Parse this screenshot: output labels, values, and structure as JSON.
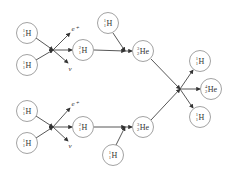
{
  "diagram": {
    "nodes": [
      {
        "id": "p1",
        "sym": "H",
        "mass": "1",
        "z": "1",
        "x": 27,
        "y": 33
      },
      {
        "id": "p2",
        "sym": "H",
        "mass": "1",
        "z": "1",
        "x": 27,
        "y": 65
      },
      {
        "id": "d1",
        "sym": "H",
        "mass": "2",
        "z": "1",
        "x": 83,
        "y": 50
      },
      {
        "id": "p5",
        "sym": "H",
        "mass": "1",
        "z": "1",
        "x": 108,
        "y": 23
      },
      {
        "id": "he3a",
        "sym": "He",
        "mass": "3",
        "z": "2",
        "x": 143,
        "y": 51
      },
      {
        "id": "p3",
        "sym": "H",
        "mass": "1",
        "z": "1",
        "x": 27,
        "y": 111
      },
      {
        "id": "p4",
        "sym": "H",
        "mass": "1",
        "z": "1",
        "x": 27,
        "y": 143
      },
      {
        "id": "d2",
        "sym": "H",
        "mass": "2",
        "z": "1",
        "x": 83,
        "y": 127
      },
      {
        "id": "p6",
        "sym": "H",
        "mass": "1",
        "z": "1",
        "x": 113,
        "y": 155
      },
      {
        "id": "he3b",
        "sym": "He",
        "mass": "3",
        "z": "2",
        "x": 143,
        "y": 127
      },
      {
        "id": "out1",
        "sym": "H",
        "mass": "1",
        "z": "1",
        "x": 200,
        "y": 61
      },
      {
        "id": "he4",
        "sym": "He",
        "mass": "4",
        "z": "2",
        "x": 211,
        "y": 89
      },
      {
        "id": "out2",
        "sym": "H",
        "mass": "1",
        "z": "1",
        "x": 200,
        "y": 117
      }
    ],
    "particles": [
      {
        "id": "e1",
        "label": "e⁺",
        "x": 75,
        "y": 29
      },
      {
        "id": "nu1",
        "label": "ν",
        "x": 70,
        "y": 69
      },
      {
        "id": "e2",
        "label": "e⁺",
        "x": 75,
        "y": 104
      },
      {
        "id": "nu2",
        "label": "ν",
        "x": 70,
        "y": 146
      }
    ]
  }
}
